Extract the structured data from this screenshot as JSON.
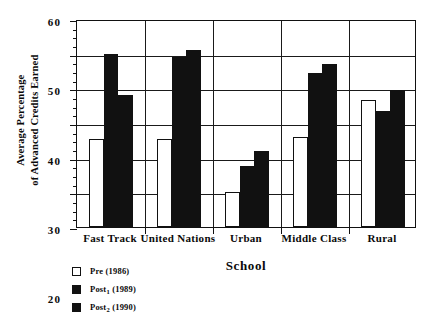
{
  "chart_data": {
    "type": "bar",
    "title": "",
    "xlabel": "School",
    "ylabel_line1": "Average Percentage",
    "ylabel_line2": "of Advanced Credits Earned",
    "categories": [
      "Fast Track",
      "United Nations",
      "Urban",
      "Middle Class",
      "Rural"
    ],
    "series": [
      {
        "name": "Pre (1986)",
        "legend_base": "Pre",
        "legend_sub": "",
        "legend_year": "(1986)",
        "style": "open",
        "color": "#ffffff",
        "values": [
          25.5,
          25.5,
          10,
          26,
          36.5
        ]
      },
      {
        "name": "Post1 (1989)",
        "legend_base": "Post",
        "legend_sub": "1",
        "legend_year": "(1989)",
        "style": "filled",
        "color": "#111111",
        "values": [
          50,
          49,
          17.5,
          44.5,
          33.5
        ]
      },
      {
        "name": "Post2 (1990)",
        "legend_base": "Post",
        "legend_sub": "2",
        "legend_year": "(1990)",
        "style": "filled",
        "color": "#111111",
        "values": [
          38,
          51,
          22,
          47,
          39.5
        ]
      }
    ],
    "ylim": [
      0,
      60
    ],
    "ytick_labels": [
      "0",
      "10",
      "20",
      "30",
      "40",
      "50",
      "60"
    ],
    "ytick_values": [
      0,
      10,
      20,
      30,
      40,
      50,
      60
    ],
    "yminor_step": 2.5,
    "grid": "horizontal-and-category-separators",
    "legend_position": "below-left"
  }
}
